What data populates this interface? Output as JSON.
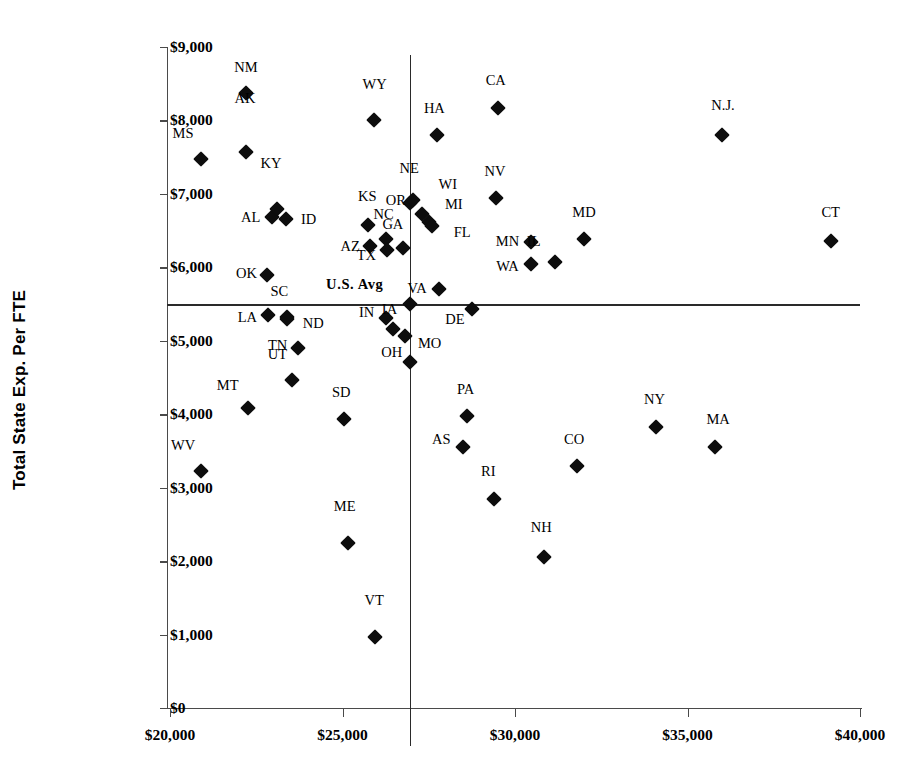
{
  "chart_data": {
    "type": "scatter",
    "title": "",
    "xlabel": "",
    "ylabel": "Total State Exp. Per FTE",
    "xlim": [
      20000,
      40000
    ],
    "ylim": [
      0,
      9000
    ],
    "xticks": [
      20000,
      25000,
      30000,
      35000,
      40000
    ],
    "xticklabels": [
      "$20,000",
      "$25,000",
      "$30,000",
      "$35,000",
      "$40,000"
    ],
    "yticks": [
      0,
      1000,
      2000,
      3000,
      4000,
      5000,
      6000,
      7000,
      8000,
      9000
    ],
    "yticklabels": [
      "$0",
      "$1,000",
      "$2,000",
      "$3,000",
      "$4,000",
      "$5,000",
      "$6,000",
      "$7,000",
      "$8,000",
      "$9,000"
    ],
    "grid": false,
    "legend": null,
    "marker": "diamond",
    "marker_color": "#0d0d0d",
    "reference_lines": {
      "label": "U.S. Avg",
      "x": 26950,
      "y": 5500,
      "color": "#2a2a2a"
    },
    "points": [
      {
        "label": "MS",
        "x": 20900,
        "y": 7470,
        "lx": -18,
        "ly": -26
      },
      {
        "label": "WV",
        "x": 20900,
        "y": 3230,
        "lx": -18,
        "ly": -26
      },
      {
        "label": "NM",
        "x": 22200,
        "y": 8370,
        "lx": 0,
        "ly": -26
      },
      {
        "label": "AK",
        "x": 22200,
        "y": 7570,
        "lx": -1,
        "ly": -54
      },
      {
        "label": "MT",
        "x": 22250,
        "y": 4090,
        "lx": -20,
        "ly": -23
      },
      {
        "label": "OK",
        "x": 22800,
        "y": 5890,
        "lx": -20,
        "ly": -2
      },
      {
        "label": "AL",
        "x": 22950,
        "y": 6690,
        "lx": -21,
        "ly": 0
      },
      {
        "label": "KY",
        "x": 23100,
        "y": 6800,
        "lx": -6,
        "ly": -46
      },
      {
        "label": "ID",
        "x": 23350,
        "y": 6660,
        "lx": 23,
        "ly": 0
      },
      {
        "label": "LA",
        "x": 22850,
        "y": 5350,
        "lx": -21,
        "ly": 2
      },
      {
        "label": "SC",
        "x": 23400,
        "y": 5330,
        "lx": -8,
        "ly": -26
      },
      {
        "label": "ND",
        "x": 23400,
        "y": 5290,
        "lx": 26,
        "ly": 4
      },
      {
        "label": "UT",
        "x": 23550,
        "y": 4470,
        "lx": -15,
        "ly": -26
      },
      {
        "label": "TN",
        "x": 23700,
        "y": 4900,
        "lx": -20,
        "ly": -3
      },
      {
        "label": "SD",
        "x": 25050,
        "y": 3930,
        "lx": -3,
        "ly": -27
      },
      {
        "label": "ME",
        "x": 25150,
        "y": 2240,
        "lx": -3,
        "ly": -37
      },
      {
        "label": "WY",
        "x": 25900,
        "y": 8010,
        "lx": 1,
        "ly": -36
      },
      {
        "label": "KS",
        "x": 25750,
        "y": 6580,
        "lx": -1,
        "ly": -29
      },
      {
        "label": "AZ",
        "x": 25800,
        "y": 6290,
        "lx": -20,
        "ly": 0
      },
      {
        "label": "VT",
        "x": 25950,
        "y": 960,
        "lx": -1,
        "ly": -37
      },
      {
        "label": "NC",
        "x": 26250,
        "y": 6380,
        "lx": -2,
        "ly": -25
      },
      {
        "label": "TX",
        "x": 26300,
        "y": 6230,
        "lx": -21,
        "ly": 5
      },
      {
        "label": "IN",
        "x": 26250,
        "y": 5310,
        "lx": -19,
        "ly": -6
      },
      {
        "label": "IA",
        "x": 26450,
        "y": 5160,
        "lx": -3,
        "ly": -20
      },
      {
        "label": "GA",
        "x": 26750,
        "y": 6260,
        "lx": -10,
        "ly": -24
      },
      {
        "label": "OR",
        "x": 26950,
        "y": 6880,
        "lx": -14,
        "ly": -3
      },
      {
        "label": "NE",
        "x": 27050,
        "y": 6920,
        "lx": -4,
        "ly": -32
      },
      {
        "label": "MO",
        "x": 26800,
        "y": 5060,
        "lx": 25,
        "ly": 7
      },
      {
        "label": "OH",
        "x": 26950,
        "y": 4710,
        "lx": -18,
        "ly": -10
      },
      {
        "label": "WI",
        "x": 27300,
        "y": 6720,
        "lx": 26,
        "ly": -30
      },
      {
        "label": "MI",
        "x": 27500,
        "y": 6620,
        "lx": 25,
        "ly": -18
      },
      {
        "label": "FL",
        "x": 27600,
        "y": 6560,
        "lx": 30,
        "ly": 6
      },
      {
        "label": "HA",
        "x": 27750,
        "y": 7800,
        "lx": -3,
        "ly": -27
      },
      {
        "label": "VA",
        "x": 27800,
        "y": 5700,
        "lx": -22,
        "ly": -1
      },
      {
        "label": "U.S. Avg",
        "x": 26950,
        "y": 5500,
        "lx": -55,
        "ly": -20,
        "is_avg": true
      },
      {
        "label": "PA",
        "x": 28600,
        "y": 3970,
        "lx": -1,
        "ly": -27
      },
      {
        "label": "AS",
        "x": 28500,
        "y": 3550,
        "lx": -22,
        "ly": -8
      },
      {
        "label": "DE",
        "x": 28750,
        "y": 5430,
        "lx": -17,
        "ly": 10
      },
      {
        "label": "RI",
        "x": 29400,
        "y": 2850,
        "lx": -6,
        "ly": -28
      },
      {
        "label": "CA",
        "x": 29500,
        "y": 8170,
        "lx": -2,
        "ly": -28
      },
      {
        "label": "NV",
        "x": 29450,
        "y": 6950,
        "lx": -1,
        "ly": -27
      },
      {
        "label": "MN",
        "x": 30450,
        "y": 6340,
        "lx": -23,
        "ly": -1
      },
      {
        "label": "WA",
        "x": 30450,
        "y": 6040,
        "lx": -23,
        "ly": 2
      },
      {
        "label": "NH",
        "x": 30850,
        "y": 2050,
        "lx": -3,
        "ly": -30
      },
      {
        "label": "IL",
        "x": 31150,
        "y": 6070,
        "lx": -21,
        "ly": -21
      },
      {
        "label": "CO",
        "x": 31800,
        "y": 3290,
        "lx": -3,
        "ly": -27
      },
      {
        "label": "MD",
        "x": 32000,
        "y": 6380,
        "lx": 0,
        "ly": -27
      },
      {
        "label": "NY",
        "x": 34100,
        "y": 3830,
        "lx": -2,
        "ly": -28
      },
      {
        "label": "N.J.",
        "x": 36000,
        "y": 7800,
        "lx": 1,
        "ly": -30
      },
      {
        "label": "MA",
        "x": 35800,
        "y": 3560,
        "lx": 3,
        "ly": -28
      },
      {
        "label": "CT",
        "x": 39150,
        "y": 6360,
        "lx": 0,
        "ly": -29
      }
    ]
  }
}
